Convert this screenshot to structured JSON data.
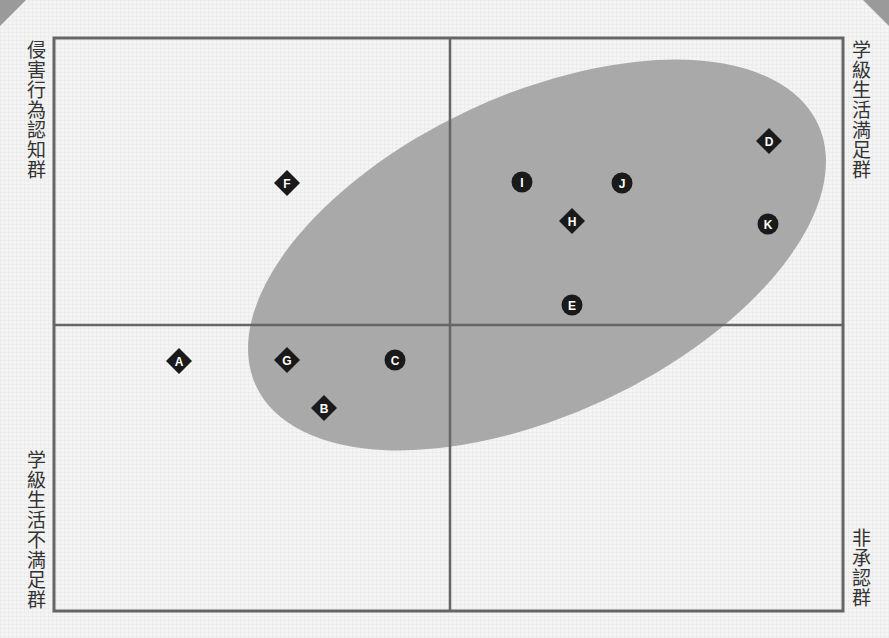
{
  "chart_data": {
    "type": "scatter",
    "title": "",
    "quadrant_labels": {
      "top_left": "侵害行為認知群",
      "top_right": "学級生活満足群",
      "bottom_left": "学級生活不満足群",
      "bottom_right": "非承認群"
    },
    "xlabel": "",
    "ylabel": "",
    "grid": false,
    "legend": null,
    "frame": {
      "left": 54,
      "top": 38,
      "right": 843,
      "bottom": 611
    },
    "axes_center": {
      "x": 450,
      "y": 325
    },
    "highlight_region": {
      "shape": "ellipse",
      "cx": 537,
      "cy": 255,
      "rx": 310,
      "ry": 160,
      "rotation_deg": -25,
      "color": "#a9a9a9"
    },
    "points": [
      {
        "label": "A",
        "shape": "diamond",
        "px": 179,
        "py": 361
      },
      {
        "label": "B",
        "shape": "diamond",
        "px": 324,
        "py": 408
      },
      {
        "label": "C",
        "shape": "circle",
        "px": 395,
        "py": 360
      },
      {
        "label": "D",
        "shape": "diamond",
        "px": 769,
        "py": 141
      },
      {
        "label": "E",
        "shape": "circle",
        "px": 572,
        "py": 305
      },
      {
        "label": "F",
        "shape": "diamond",
        "px": 287,
        "py": 183
      },
      {
        "label": "G",
        "shape": "diamond",
        "px": 287,
        "py": 360
      },
      {
        "label": "H",
        "shape": "diamond",
        "px": 572,
        "py": 221
      },
      {
        "label": "I",
        "shape": "circle",
        "px": 522,
        "py": 182
      },
      {
        "label": "J",
        "shape": "circle",
        "px": 622,
        "py": 183
      },
      {
        "label": "K",
        "shape": "circle",
        "px": 768,
        "py": 224
      }
    ],
    "colors": {
      "marker": "#1a1a1a",
      "marker_text": "#ffffff",
      "axis": "#666666",
      "ellipse": "#a9a9a9"
    }
  }
}
